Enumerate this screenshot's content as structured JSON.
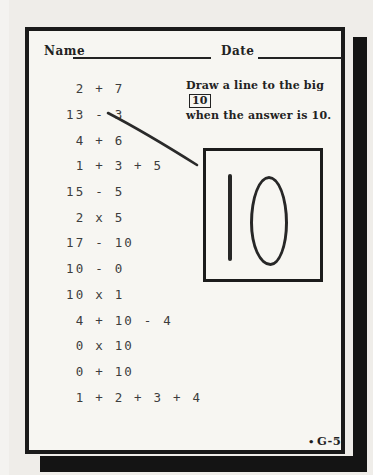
{
  "header": {
    "name_label": "Name",
    "date_label": "Date"
  },
  "instruction": {
    "line1": "Draw a line to the big",
    "boxed_value": "10",
    "line2": "when the answer is 10."
  },
  "problems": [
    " 2 + 7",
    "13 - 3",
    " 4 + 6",
    " 1 + 3 + 5",
    "15 - 5",
    " 2 x 5",
    "17 - 10",
    "10 - 0",
    "10 x 1",
    " 4 + 10 - 4",
    " 0 x 10",
    " 0 + 10",
    " 1 + 2 + 3 + 4"
  ],
  "big_ten": {
    "value": "10"
  },
  "connection": {
    "from_expression": "13 - 3",
    "to": "big-ten-box"
  },
  "footer": {
    "bullet": "•",
    "code": "G-5"
  },
  "colors": {
    "paper": "#f7f6f2",
    "ink": "#222222",
    "typewriter_ink": "#3d3d3d",
    "frame_border": "#1a1a1a",
    "shadow": "#141414"
  }
}
